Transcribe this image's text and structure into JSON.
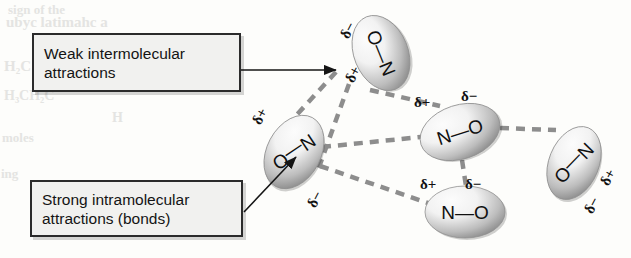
{
  "figure": {
    "background_color": "#fdfdfb"
  },
  "bleed_text": [
    {
      "text": "sign of the",
      "x": 8,
      "y": 2,
      "size": 13
    },
    {
      "text": "ubyc latimahc a",
      "x": 6,
      "y": 14,
      "size": 15
    },
    {
      "text": "H₂C CH₃ C",
      "x": 4,
      "y": 58,
      "size": 15
    },
    {
      "text": "(CH₃)₂",
      "x": 150,
      "y": 52,
      "size": 16
    },
    {
      "text": "H₃CH₂C",
      "x": 4,
      "y": 88,
      "size": 14
    },
    {
      "text": "H",
      "x": 112,
      "y": 110,
      "size": 14
    },
    {
      "text": "moles",
      "x": 2,
      "y": 130,
      "size": 13
    },
    {
      "text": "ing",
      "x": 1,
      "y": 166,
      "size": 13
    }
  ],
  "callouts": [
    {
      "name": "weak-intermolecular-callout",
      "text": "Weak intermolecular\nattractions",
      "x": 32,
      "y": 33,
      "w": 209,
      "h": 59
    },
    {
      "name": "strong-intramolecular-callout",
      "text": "Strong intramolecular\nattractions (bonds)",
      "x": 30,
      "y": 180,
      "w": 213,
      "h": 57
    }
  ],
  "pointers": [
    {
      "name": "weak-attraction-pointer",
      "from_x": 241,
      "from_y": 70,
      "to_x": 336,
      "to_y": 70,
      "style": "straight-arrow"
    },
    {
      "name": "strong-bond-pointer",
      "from_x": 244,
      "from_y": 212,
      "to_x": 296,
      "to_y": 157,
      "style": "straight-arrow"
    }
  ],
  "molecules": [
    {
      "name": "molecule-top",
      "atoms": [
        "O",
        "N"
      ],
      "bond_label": "O—N",
      "cx": 381,
      "cy": 53,
      "rx": 27,
      "ry": 39,
      "rotation": -22,
      "text_rotation": 90,
      "partial_charges": [
        {
          "sign": "δ−",
          "x": 340,
          "y": 22,
          "rotation": -62
        },
        {
          "sign": "δ+",
          "x": 345,
          "y": 66,
          "rotation": -62
        }
      ]
    },
    {
      "name": "molecule-left",
      "atoms": [
        "N",
        "O"
      ],
      "bond_label": "N—O",
      "cx": 294,
      "cy": 152,
      "rx": 27,
      "ry": 39,
      "rotation": 28,
      "text_rotation": 118,
      "partial_charges": [
        {
          "sign": "δ+",
          "x": 252,
          "y": 108,
          "rotation": -62
        },
        {
          "sign": "δ−",
          "x": 307,
          "y": 191,
          "rotation": -62
        }
      ]
    },
    {
      "name": "molecule-center",
      "atoms": [
        "N",
        "O"
      ],
      "bond_label": "N—O",
      "cx": 460,
      "cy": 132,
      "rx": 41,
      "ry": 27,
      "rotation": -18,
      "text_rotation": 0,
      "partial_charges": [
        {
          "sign": "δ+",
          "x": 414,
          "y": 94,
          "rotation": 0
        },
        {
          "sign": "δ−",
          "x": 461,
          "y": 88,
          "rotation": 0
        }
      ]
    },
    {
      "name": "molecule-bottom",
      "atoms": [
        "N",
        "O"
      ],
      "bond_label": "N—O",
      "cx": 465,
      "cy": 212,
      "rx": 40,
      "ry": 26,
      "rotation": 0,
      "text_rotation": 0,
      "partial_charges": [
        {
          "sign": "δ+",
          "x": 420,
          "y": 176,
          "rotation": 0
        },
        {
          "sign": "δ−",
          "x": 465,
          "y": 176,
          "rotation": 0
        }
      ]
    },
    {
      "name": "molecule-right",
      "atoms": [
        "N",
        "O"
      ],
      "bond_label": "N—O",
      "cx": 574,
      "cy": 163,
      "rx": 25,
      "ry": 38,
      "rotation": 22,
      "text_rotation": 112,
      "partial_charges": [
        {
          "sign": "δ+",
          "x": 600,
          "y": 169,
          "rotation": -62
        },
        {
          "sign": "δ−",
          "x": 584,
          "y": 197,
          "rotation": -62
        }
      ]
    }
  ],
  "attraction_lines": [
    {
      "name": "line-top-to-left",
      "x1": 336,
      "y1": 72,
      "x2": 292,
      "y2": 120
    },
    {
      "name": "line-top-to-center",
      "x1": 370,
      "y1": 90,
      "x2": 440,
      "y2": 106
    },
    {
      "name": "line-top-center-inner",
      "x1": 349,
      "y1": 84,
      "x2": 318,
      "y2": 170
    },
    {
      "name": "line-left-to-center",
      "x1": 322,
      "y1": 147,
      "x2": 421,
      "y2": 137
    },
    {
      "name": "line-left-to-bottom",
      "x1": 320,
      "y1": 166,
      "x2": 428,
      "y2": 203
    },
    {
      "name": "line-center-to-bottom",
      "x1": 462,
      "y1": 160,
      "x2": 466,
      "y2": 186
    },
    {
      "name": "line-center-to-right",
      "x1": 500,
      "y1": 128,
      "x2": 556,
      "y2": 130
    }
  ],
  "colors": {
    "line": "#8d8d8d",
    "box_fill": "#f1f1ef",
    "box_border": "#2b2b2b",
    "text": "#141414",
    "molecule_light": "#f2f2f2",
    "molecule_dark": "#7e7e7e"
  }
}
